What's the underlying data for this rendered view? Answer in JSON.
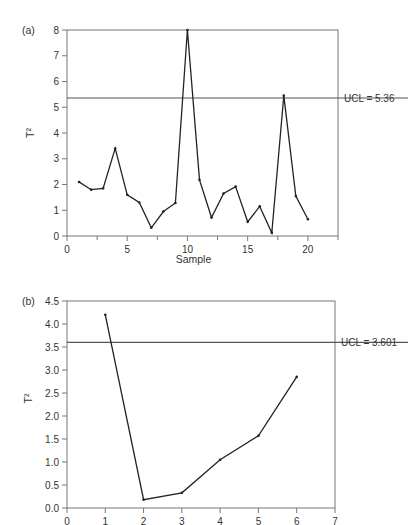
{
  "chart_data": [
    {
      "panel": "(a)",
      "type": "line",
      "title": "",
      "xlabel": "Sample",
      "ylabel": "T²",
      "xlim": [
        0,
        22.5
      ],
      "ylim": [
        0,
        8
      ],
      "xticks": [
        0,
        5,
        10,
        15,
        20
      ],
      "yticks": [
        0,
        1,
        2,
        3,
        4,
        5,
        6,
        7,
        8
      ],
      "grid": false,
      "x": [
        1,
        2,
        3,
        4,
        5,
        6,
        7,
        8,
        9,
        10,
        11,
        12,
        13,
        14,
        15,
        16,
        17,
        18,
        19,
        20
      ],
      "values": [
        2.1,
        1.8,
        1.85,
        3.4,
        1.6,
        1.3,
        0.32,
        0.95,
        1.28,
        8.0,
        2.18,
        0.72,
        1.65,
        1.92,
        0.55,
        1.15,
        0.13,
        5.45,
        1.55,
        0.65
      ],
      "reference_lines": [
        {
          "label": "UCL = 5.36",
          "y": 5.36
        }
      ]
    },
    {
      "panel": "(b)",
      "type": "line",
      "title": "",
      "xlabel": "",
      "ylabel": "T²",
      "xlim": [
        0,
        7
      ],
      "ylim": [
        0,
        4.5
      ],
      "xticks": [
        0,
        1,
        2,
        3,
        4,
        5,
        6,
        7
      ],
      "yticks": [
        0.0,
        0.5,
        1.0,
        1.5,
        2.0,
        2.5,
        3.0,
        3.5,
        4.0,
        4.5
      ],
      "ytick_labels": [
        "0.0",
        "0.5",
        "1.0",
        "1.5",
        "2.0",
        "2.5",
        "3.0",
        "3.5",
        "4.0",
        "4.5"
      ],
      "grid": false,
      "x": [
        1,
        2,
        3,
        4,
        5,
        6
      ],
      "values": [
        4.2,
        0.18,
        0.33,
        1.05,
        1.57,
        2.85
      ],
      "reference_lines": [
        {
          "label": "UCL = 3.601",
          "y": 3.601
        }
      ]
    }
  ],
  "panels": {
    "a": {
      "label": "(a)",
      "xlabel": "Sample",
      "ylabel": "T²",
      "ucl_label": "UCL = 5.36"
    },
    "b": {
      "label": "(b)",
      "ylabel": "T²",
      "ucl_label": "UCL = 3.601"
    }
  },
  "colors": {
    "line": "#222222",
    "axis": "#777777",
    "ucl": "#555555"
  }
}
